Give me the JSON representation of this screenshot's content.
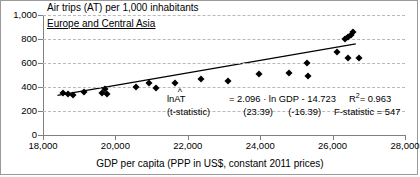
{
  "chart_data": {
    "type": "scatter",
    "title": "Air trips (AT) per 1,000 inhabitants",
    "region_label": "Europe and Central Asia",
    "xlabel": "GDP per capita (PPP in US$, constant 2011 prices)",
    "ylabel": "Air trips (AT) per 1,000 inhabitants",
    "xlim": [
      18000,
      28000
    ],
    "ylim": [
      0,
      1000
    ],
    "xticks": [
      "18,000",
      "20,000",
      "22,000",
      "24,000",
      "26,000",
      "28,000"
    ],
    "xtick_values": [
      18000,
      20000,
      22000,
      24000,
      26000,
      28000
    ],
    "yticks": [
      "0",
      "200",
      "400",
      "600",
      "800",
      "1,000"
    ],
    "ytick_values": [
      0,
      200,
      400,
      600,
      800,
      1000
    ],
    "grid": "horizontal-dashed",
    "legend": "none",
    "marker_style": "black-diamond",
    "points": [
      {
        "x": 18560,
        "y": 350
      },
      {
        "x": 18700,
        "y": 338
      },
      {
        "x": 18840,
        "y": 330
      },
      {
        "x": 19140,
        "y": 362
      },
      {
        "x": 19620,
        "y": 352
      },
      {
        "x": 19700,
        "y": 382
      },
      {
        "x": 19760,
        "y": 345
      },
      {
        "x": 20560,
        "y": 400
      },
      {
        "x": 20940,
        "y": 432
      },
      {
        "x": 21120,
        "y": 388
      },
      {
        "x": 21640,
        "y": 430
      },
      {
        "x": 22360,
        "y": 470
      },
      {
        "x": 23100,
        "y": 446
      },
      {
        "x": 23960,
        "y": 506
      },
      {
        "x": 24800,
        "y": 520
      },
      {
        "x": 25280,
        "y": 598
      },
      {
        "x": 25320,
        "y": 492
      },
      {
        "x": 26120,
        "y": 690
      },
      {
        "x": 26340,
        "y": 800
      },
      {
        "x": 26420,
        "y": 818
      },
      {
        "x": 26500,
        "y": 836
      },
      {
        "x": 26560,
        "y": 858
      },
      {
        "x": 26420,
        "y": 640
      },
      {
        "x": 26740,
        "y": 644
      }
    ],
    "trendline": {
      "type": "log-log fit rendered in level space",
      "x_start": 18400,
      "y_start": 330,
      "x_end": 26640,
      "y_end": 760
    },
    "annotation": {
      "equation_prefix": "ln",
      "equation_var": "AT",
      "equation_hat": "^",
      "equation_body": "= 2.096 · ln GDP - 14.723",
      "r2_label": "R",
      "r2_sup": "2",
      "r2_value": "= 0.963",
      "tstat_label": "(t-statistic)",
      "tstat_slope": "(23.39)",
      "tstat_intercept": "(-16.39)",
      "fstat": "F-statistic = 547"
    },
    "colors": {
      "marker": "#000000",
      "trendline": "#000000",
      "gridline": "#b9b9b9",
      "axis": "#808080",
      "text": "#000000",
      "background": "#ffffff",
      "border": "#9a9a9a"
    }
  }
}
